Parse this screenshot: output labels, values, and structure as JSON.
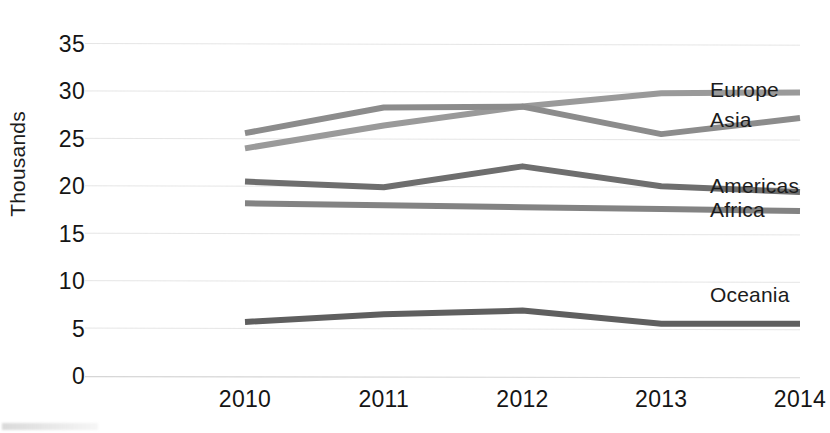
{
  "chart_data": {
    "type": "line",
    "title": "",
    "subtitle": "",
    "xlabel": "",
    "ylabel": "Thousands",
    "categories": [
      "2010",
      "2011",
      "2012",
      "2013",
      "2014"
    ],
    "x": [
      2010,
      2011,
      2012,
      2013,
      2014
    ],
    "ylim": [
      0,
      35
    ],
    "yticks": [
      0,
      5,
      10,
      15,
      20,
      25,
      30,
      35
    ],
    "ytick_labels": [
      "0",
      "5",
      "10",
      "15",
      "20",
      "25",
      "30",
      "35"
    ],
    "grid": true,
    "grid_axis": "y",
    "legend": "inline-end-of-line",
    "units": "Thousands",
    "series": [
      {
        "name": "Europe",
        "label": "Europe",
        "color": "#9a9a9a",
        "values": [
          24.0,
          26.4,
          28.4,
          29.8,
          29.9
        ],
        "label_y": 29.9
      },
      {
        "name": "Asia",
        "label": "Asia",
        "color": "#8c8c8c",
        "values": [
          25.6,
          28.3,
          28.4,
          25.5,
          27.2
        ],
        "label_y": 26.8
      },
      {
        "name": "Americas",
        "label": "Americas",
        "color": "#6e6e6e",
        "values": [
          20.5,
          19.9,
          22.1,
          20.0,
          19.4
        ],
        "label_y": 19.8
      },
      {
        "name": "Africa",
        "label": "Africa",
        "color": "#838383",
        "values": [
          18.2,
          18.0,
          17.8,
          17.6,
          17.4
        ],
        "label_y": 17.3
      },
      {
        "name": "Oceania",
        "label": "Oceania",
        "color": "#5f5f5f",
        "values": [
          5.7,
          6.5,
          6.9,
          5.5,
          5.5
        ],
        "label_y": 8.3
      }
    ]
  },
  "axis": {
    "y_title": "Thousands"
  }
}
